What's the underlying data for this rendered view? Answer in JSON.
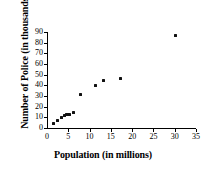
{
  "chart_data": {
    "type": "scatter",
    "title": "",
    "xlabel": "Population (in millions)",
    "ylabel": "Number of Police (in thousands)",
    "xlim": [
      0,
      35
    ],
    "ylim": [
      0,
      90
    ],
    "xticks": [
      0,
      5,
      10,
      15,
      20,
      25,
      30,
      35
    ],
    "xtick_labels": [
      "0",
      "5",
      "10",
      "15",
      "20",
      "25",
      "30",
      "35"
    ],
    "yticks": [
      0,
      10,
      20,
      30,
      40,
      50,
      60,
      70,
      80,
      90
    ],
    "ytick_labels": [
      "0",
      "10",
      "20",
      "30",
      "40",
      "50",
      "60",
      "70",
      "80",
      "90"
    ],
    "grid": false,
    "legend": false,
    "marker_color": "#111111",
    "axis_color": "#000000",
    "points": [
      {
        "x": 1.5,
        "y": 4.0
      },
      {
        "x": 2.5,
        "y": 7.0
      },
      {
        "x": 3.3,
        "y": 10.0
      },
      {
        "x": 4.0,
        "y": 12.0
      },
      {
        "x": 4.5,
        "y": 12.5
      },
      {
        "x": 5.0,
        "y": 13.0
      },
      {
        "x": 5.4,
        "y": 13.0
      },
      {
        "x": 6.2,
        "y": 15.0
      },
      {
        "x": 7.8,
        "y": 31.0
      },
      {
        "x": 11.5,
        "y": 40.0
      },
      {
        "x": 13.3,
        "y": 45.0
      },
      {
        "x": 17.2,
        "y": 46.0
      },
      {
        "x": 30.3,
        "y": 86.5
      }
    ]
  }
}
